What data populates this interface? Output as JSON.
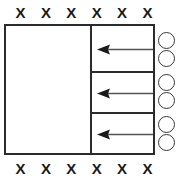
{
  "diagram": {
    "colors": {
      "stroke": "#2b2b2b",
      "bead_stroke": "#3a3a3a",
      "marker": "#1a1a1a",
      "arrow": "#555555",
      "background": "#ffffff"
    },
    "top_markers": {
      "label": "top marker row",
      "symbols": [
        "X",
        "X",
        "X",
        "X",
        "X",
        "X"
      ]
    },
    "bottom_markers": {
      "label": "bottom marker row",
      "symbols": [
        "X",
        "X",
        "X",
        "X",
        "X",
        "X"
      ]
    },
    "vessel": {
      "label": "outer rectangle",
      "left_chamber_label": "",
      "cells": [
        {
          "name": "flow cell 1",
          "arrow_direction": "left",
          "arrow_label": ""
        },
        {
          "name": "flow cell 2",
          "arrow_direction": "left",
          "arrow_label": ""
        },
        {
          "name": "flow cell 3",
          "arrow_direction": "left",
          "arrow_label": ""
        }
      ]
    },
    "beads": {
      "label": "circle column",
      "count": 6,
      "items": [
        {
          "name": "circle 1"
        },
        {
          "name": "circle 2"
        },
        {
          "name": "circle 3"
        },
        {
          "name": "circle 4"
        },
        {
          "name": "circle 5"
        },
        {
          "name": "circle 6"
        }
      ]
    }
  }
}
